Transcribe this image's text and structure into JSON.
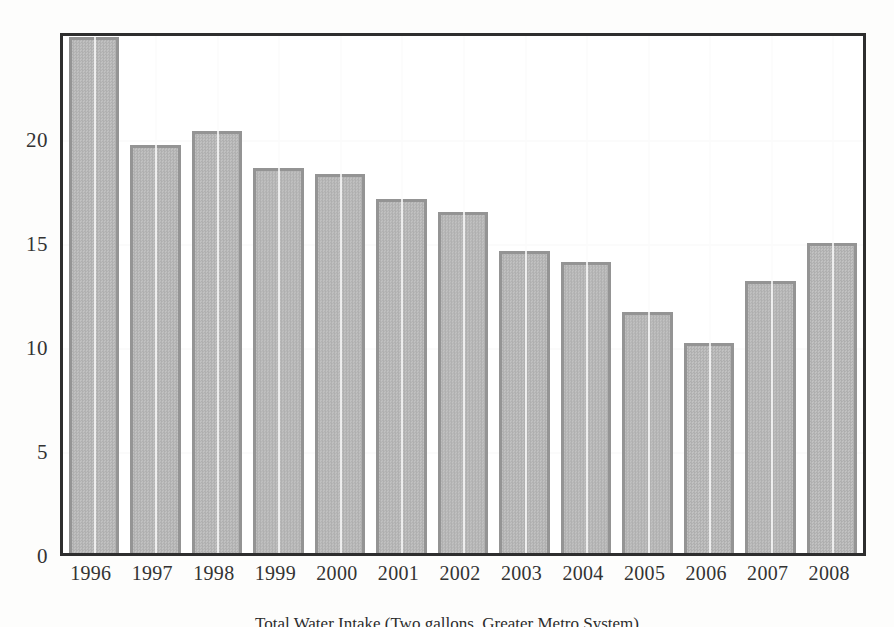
{
  "chart_data": {
    "type": "bar",
    "title": "",
    "caption": "Total Water Intake (Two gallons, Greater Metro System)",
    "xlabel": "",
    "ylabel": "",
    "categories": [
      "1996",
      "1997",
      "1998",
      "1999",
      "2000",
      "2001",
      "2002",
      "2003",
      "2004",
      "2005",
      "2006",
      "2007",
      "2008"
    ],
    "values": [
      24.8,
      19.6,
      20.3,
      18.5,
      18.2,
      17.0,
      16.4,
      14.5,
      14.0,
      11.6,
      10.1,
      13.1,
      14.9
    ],
    "yticks": [
      0,
      5,
      10,
      15,
      20
    ],
    "ytick_labels": [
      "0",
      "5",
      "10",
      "15",
      "20"
    ],
    "ylim": [
      0,
      24.8
    ],
    "xlim_note": "categorical, 13 bars",
    "grid": "white gridlines at each y tick and at each bar center, drawn over bars",
    "legend": "none",
    "bar_fill_color": "#bcbcbc",
    "bar_edge_color": "#949494",
    "frame_color": "#2e2e2e",
    "background_color": "#ffffff",
    "first_bar_clipped": true
  },
  "axis": {
    "y_tick_0": "0",
    "y_tick_5": "5",
    "y_tick_10": "10",
    "y_tick_15": "15",
    "y_tick_20": "20"
  }
}
